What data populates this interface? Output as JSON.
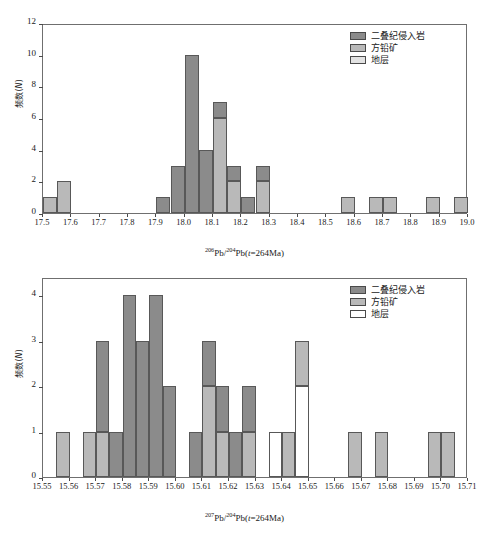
{
  "figure": {
    "background": "#ffffff",
    "panel_count": 2
  },
  "colors": {
    "permian": "#8b8b8b",
    "galena": "#b9b9b9",
    "strata": "#e2e2e2",
    "axis": "#6f6f6f",
    "text": "#1a1a1a"
  },
  "legend": {
    "position": "top-right",
    "items": [
      {
        "label": "二叠纪侵入岩",
        "color": "#8b8b8b",
        "key": "permian"
      },
      {
        "label": "方铅矿",
        "color": "#b9b9b9",
        "key": "galena"
      },
      {
        "label": "地层",
        "color": "#e2e2e2",
        "key": "strata"
      }
    ]
  },
  "chart_data": [
    {
      "id": "pb206",
      "type": "bar",
      "subtype": "stacked-histogram",
      "title": "",
      "xlabel": "206Pb/204Pb(t=264Ma)",
      "xlabel_parts": {
        "sup1": "206",
        "mid": "Pb/",
        "sup2": "204",
        "tail": "Pb(",
        "italic": "t",
        "end": "=264Ma)"
      },
      "ylabel": "频数(N)",
      "ylabel_parts": {
        "text": "频数(",
        "italic": "N",
        "tail": ")"
      },
      "xlim": [
        17.5,
        19.0
      ],
      "ylim": [
        0,
        12
      ],
      "bin_width": 0.05,
      "xticks": [
        "17.5",
        "17.6",
        "17.7",
        "17.8",
        "17.9",
        "18.0",
        "18.1",
        "18.2",
        "18.3",
        "18.4",
        "18.5",
        "18.6",
        "18.7",
        "18.8",
        "18.9",
        "19.0"
      ],
      "xtick_values": [
        17.5,
        17.6,
        17.7,
        17.8,
        17.9,
        18.0,
        18.1,
        18.2,
        18.3,
        18.4,
        18.5,
        18.6,
        18.7,
        18.8,
        18.9,
        19.0
      ],
      "yticks": [
        "0",
        "2",
        "4",
        "6",
        "8",
        "10",
        "12"
      ],
      "ytick_values": [
        0,
        2,
        4,
        6,
        8,
        10,
        12
      ],
      "grid": false,
      "series": [
        {
          "name": "二叠纪侵入岩",
          "key": "permian",
          "color": "#8b8b8b"
        },
        {
          "name": "方铅矿",
          "key": "galena",
          "color": "#b9b9b9"
        },
        {
          "name": "地层",
          "key": "strata",
          "color": "#e2e2e2"
        }
      ],
      "bins": [
        {
          "x0": 17.5,
          "x1": 17.55,
          "permian": 0,
          "galena": 1,
          "strata": 0,
          "total": 1
        },
        {
          "x0": 17.55,
          "x1": 17.6,
          "permian": 0,
          "galena": 2,
          "strata": 0,
          "total": 2
        },
        {
          "x0": 17.9,
          "x1": 17.95,
          "permian": 1,
          "galena": 0,
          "strata": 0,
          "total": 1
        },
        {
          "x0": 17.95,
          "x1": 18.0,
          "permian": 3,
          "galena": 0,
          "strata": 0,
          "total": 3
        },
        {
          "x0": 18.0,
          "x1": 18.05,
          "permian": 10,
          "galena": 0,
          "strata": 0,
          "total": 10
        },
        {
          "x0": 18.05,
          "x1": 18.1,
          "permian": 4,
          "galena": 0,
          "strata": 0,
          "total": 4
        },
        {
          "x0": 18.1,
          "x1": 18.15,
          "permian": 1,
          "galena": 6,
          "strata": 0,
          "total": 7
        },
        {
          "x0": 18.15,
          "x1": 18.2,
          "permian": 1,
          "galena": 2,
          "strata": 0,
          "total": 3
        },
        {
          "x0": 18.2,
          "x1": 18.25,
          "permian": 1,
          "galena": 0,
          "strata": 0,
          "total": 1
        },
        {
          "x0": 18.25,
          "x1": 18.3,
          "permian": 1,
          "galena": 2,
          "strata": 0,
          "total": 3
        },
        {
          "x0": 18.55,
          "x1": 18.6,
          "permian": 0,
          "galena": 1,
          "strata": 0,
          "total": 1
        },
        {
          "x0": 18.65,
          "x1": 18.7,
          "permian": 0,
          "galena": 1,
          "strata": 0,
          "total": 1
        },
        {
          "x0": 18.7,
          "x1": 18.75,
          "permian": 0,
          "galena": 1,
          "strata": 0,
          "total": 1
        },
        {
          "x0": 18.85,
          "x1": 18.9,
          "permian": 0,
          "galena": 1,
          "strata": 0,
          "total": 1
        },
        {
          "x0": 18.95,
          "x1": 19.0,
          "permian": 0,
          "galena": 1,
          "strata": 0,
          "total": 1
        }
      ]
    },
    {
      "id": "pb207",
      "type": "bar",
      "subtype": "stacked-histogram",
      "title": "",
      "xlabel": "207Pb/204Pb(t=264Ma)",
      "xlabel_parts": {
        "sup1": "207",
        "mid": "Pb/",
        "sup2": "204",
        "tail": "Pb(",
        "italic": "t",
        "end": "=264Ma)"
      },
      "ylabel": "频数(N)",
      "ylabel_parts": {
        "text": "频数(",
        "italic": "N",
        "tail": ")"
      },
      "xlim": [
        15.55,
        15.71
      ],
      "ylim": [
        0,
        4.4
      ],
      "bin_width": 0.005,
      "xticks": [
        "15.55",
        "15.56",
        "15.57",
        "15.58",
        "15.59",
        "15.60",
        "15.61",
        "15.62",
        "15.63",
        "15.64",
        "15.65",
        "15.66",
        "15.67",
        "15.68",
        "15.69",
        "15.70",
        "15.71"
      ],
      "xtick_values": [
        15.55,
        15.56,
        15.57,
        15.58,
        15.59,
        15.6,
        15.61,
        15.62,
        15.63,
        15.64,
        15.65,
        15.66,
        15.67,
        15.68,
        15.69,
        15.7,
        15.71
      ],
      "yticks": [
        "0",
        "1",
        "2",
        "3",
        "4"
      ],
      "ytick_values": [
        0,
        1,
        2,
        3,
        4
      ],
      "grid": false,
      "series": [
        {
          "name": "二叠纪侵入岩",
          "key": "permian",
          "color": "#8b8b8b"
        },
        {
          "name": "方铅矿",
          "key": "galena",
          "color": "#b9b9b9"
        },
        {
          "name": "地层",
          "key": "strata",
          "color": "#ffffff"
        }
      ],
      "bins": [
        {
          "x0": 15.555,
          "x1": 15.56,
          "permian": 0,
          "galena": 1,
          "strata": 0,
          "total": 1
        },
        {
          "x0": 15.565,
          "x1": 15.57,
          "permian": 0,
          "galena": 1,
          "strata": 0,
          "total": 1
        },
        {
          "x0": 15.57,
          "x1": 15.575,
          "permian": 2,
          "galena": 1,
          "strata": 0,
          "total": 3
        },
        {
          "x0": 15.575,
          "x1": 15.58,
          "permian": 1,
          "galena": 0,
          "strata": 0,
          "total": 1
        },
        {
          "x0": 15.58,
          "x1": 15.585,
          "permian": 4,
          "galena": 0,
          "strata": 0,
          "total": 4
        },
        {
          "x0": 15.585,
          "x1": 15.59,
          "permian": 3,
          "galena": 0,
          "strata": 0,
          "total": 3
        },
        {
          "x0": 15.59,
          "x1": 15.595,
          "permian": 4,
          "galena": 0,
          "strata": 0,
          "total": 4
        },
        {
          "x0": 15.595,
          "x1": 15.6,
          "permian": 2,
          "galena": 0,
          "strata": 0,
          "total": 2
        },
        {
          "x0": 15.605,
          "x1": 15.61,
          "permian": 1,
          "galena": 0,
          "strata": 0,
          "total": 1
        },
        {
          "x0": 15.61,
          "x1": 15.615,
          "permian": 1,
          "galena": 2,
          "strata": 0,
          "total": 3
        },
        {
          "x0": 15.615,
          "x1": 15.62,
          "permian": 1,
          "galena": 1,
          "strata": 0,
          "total": 2
        },
        {
          "x0": 15.62,
          "x1": 15.625,
          "permian": 1,
          "galena": 0,
          "strata": 0,
          "total": 1
        },
        {
          "x0": 15.625,
          "x1": 15.63,
          "permian": 1,
          "galena": 1,
          "strata": 0,
          "total": 2
        },
        {
          "x0": 15.635,
          "x1": 15.64,
          "permian": 0,
          "galena": 0,
          "strata": 1,
          "total": 1
        },
        {
          "x0": 15.64,
          "x1": 15.645,
          "permian": 0,
          "galena": 1,
          "strata": 0,
          "total": 1
        },
        {
          "x0": 15.645,
          "x1": 15.65,
          "permian": 0,
          "galena": 1,
          "strata": 2,
          "total": 3
        },
        {
          "x0": 15.665,
          "x1": 15.67,
          "permian": 0,
          "galena": 1,
          "strata": 0,
          "total": 1
        },
        {
          "x0": 15.675,
          "x1": 15.68,
          "permian": 0,
          "galena": 1,
          "strata": 0,
          "total": 1
        },
        {
          "x0": 15.695,
          "x1": 15.7,
          "permian": 0,
          "galena": 1,
          "strata": 0,
          "total": 1
        },
        {
          "x0": 15.7,
          "x1": 15.705,
          "permian": 0,
          "galena": 1,
          "strata": 0,
          "total": 1
        }
      ]
    }
  ]
}
